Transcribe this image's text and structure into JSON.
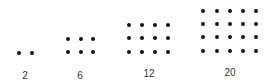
{
  "diagram": {
    "dot_color": "#111111",
    "label_color": "#333333",
    "groups": [
      {
        "label": "2",
        "rows": 1,
        "cols": 2,
        "xs": [
          19,
          32
        ],
        "ys": [
          53
        ],
        "label_pos": [
          25,
          76
        ]
      },
      {
        "label": "6",
        "rows": 2,
        "cols": 3,
        "xs": [
          68,
          81,
          93
        ],
        "ys": [
          39,
          52
        ],
        "label_pos": [
          80,
          76
        ]
      },
      {
        "label": "12",
        "rows": 3,
        "cols": 4,
        "xs": [
          129,
          142,
          155,
          168
        ],
        "ys": [
          25,
          38,
          52
        ],
        "label_pos": [
          149,
          74
        ]
      },
      {
        "label": "20",
        "rows": 4,
        "cols": 5,
        "xs": [
          203,
          217,
          230,
          243,
          256
        ],
        "ys": [
          11,
          24,
          37,
          51
        ],
        "label_pos": [
          230,
          73
        ]
      }
    ]
  }
}
